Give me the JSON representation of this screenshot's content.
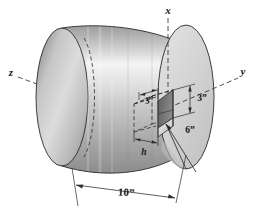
{
  "figure": {
    "background_color": "#ffffff"
  },
  "axes": [
    {
      "id": "x",
      "label": "x",
      "orientation": "vertical-up"
    },
    {
      "id": "y",
      "label": "y",
      "orientation": "right-up"
    },
    {
      "id": "z",
      "label": "z",
      "orientation": "left-up"
    }
  ],
  "dimensions": {
    "cylinder_length": "10”",
    "cutout_width": "3”",
    "cutout_height": "3”",
    "radius_callout": "6”",
    "depth_symbol": "h"
  },
  "colors": {
    "cylinder_light": "#f2f2f2",
    "cylinder_mid": "#c9c9c9",
    "cylinder_dark": "#8f8f8f",
    "face_fill": "#d6d6d6",
    "face_shadow": "#bdbdbd",
    "cutout_dark": "#6f6f6f",
    "cutout_mid": "#a3a3a3",
    "outline": "#2b2b2b"
  }
}
